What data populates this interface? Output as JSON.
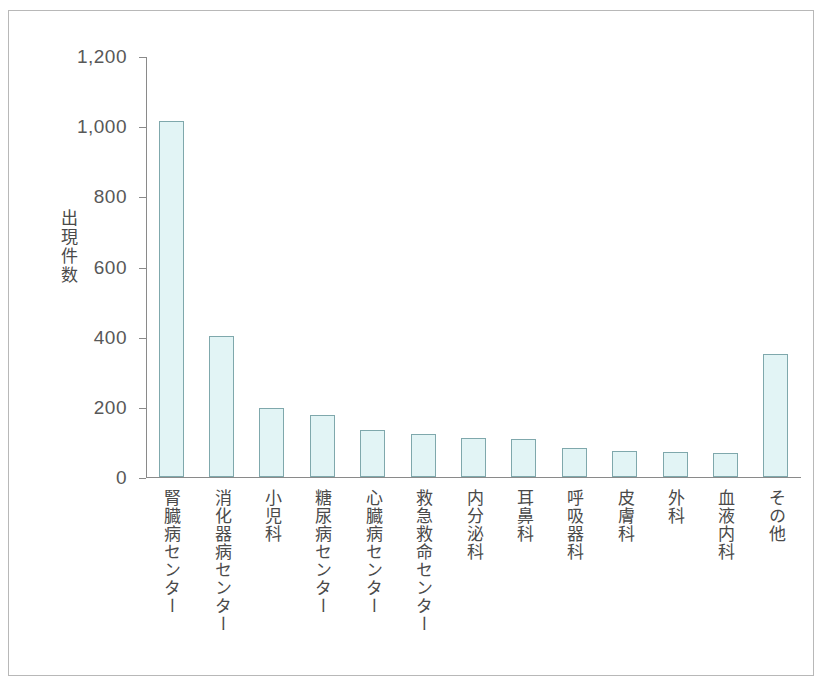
{
  "chart_data": {
    "type": "bar",
    "title": "",
    "xlabel": "",
    "ylabel": "出現件数",
    "ylim": [
      0,
      1200
    ],
    "ytick_interval": 200,
    "grid": false,
    "legend": null,
    "ytick_labels": [
      "1,200",
      "1,000",
      "800",
      "600",
      "400",
      "200",
      "0"
    ],
    "ytick_values": [
      1200,
      1000,
      800,
      600,
      400,
      200,
      0
    ],
    "categories": [
      "腎臓病センター",
      "消化器病センター",
      "小児科",
      "糖尿病センター",
      "心臓病センター",
      "救急救命センター",
      "内分泌科",
      "耳鼻科",
      "呼吸器科",
      "皮膚科",
      "外科",
      "血液内科",
      "その他"
    ],
    "values": [
      1015,
      402,
      198,
      178,
      135,
      123,
      110,
      108,
      82,
      75,
      70,
      68,
      350
    ],
    "bar_fill_color": "#e2f4f5",
    "bar_border_color": "#7fa8ac",
    "axis_color": "#8a8a8a",
    "frame_color": "#b8b8b8",
    "text_color": "#4a4a4a"
  }
}
